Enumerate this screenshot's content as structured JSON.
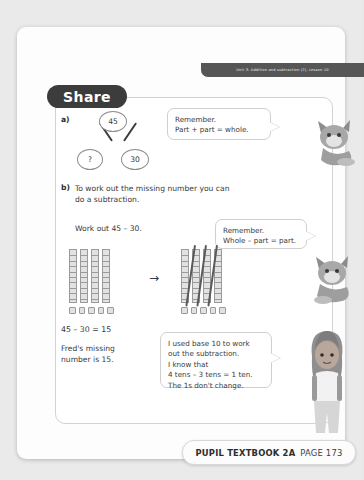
{
  "banner": {
    "unit_text": "Unit 3: Addition and subtraction (2), Lesson 10"
  },
  "section": {
    "title": "Share"
  },
  "part_a": {
    "label": "a)",
    "part_whole": {
      "whole": "45",
      "part_left": "?",
      "part_right": "30"
    },
    "bubble": {
      "line1": "Remember.",
      "line2": "Part + part = whole."
    }
  },
  "part_b": {
    "label": "b)",
    "text_line1": "To work out the missing number you can",
    "text_line2": "do a subtraction.",
    "work_out": "Work out 45 – 30.",
    "bubble": {
      "line1": "Remember.",
      "line2": "Whole – part = part."
    },
    "base_ten": {
      "left_tens": 4,
      "left_ones": 5,
      "right_tens": 4,
      "right_ones": 5,
      "crossed_tens": 3,
      "arrow_glyph": "→"
    },
    "equation": "45 – 30 = 15",
    "answer_line1": "Fred's missing",
    "answer_line2": "number is 15.",
    "bubble_big": {
      "line1": "I used base 10 to work",
      "line2": "out the subtraction.",
      "line3": "I know that",
      "line4": "4 tens – 3 tens = 1 ten.",
      "line5": "The 1s don't change."
    }
  },
  "footer": {
    "page_number": "173",
    "book_label": "PUPIL TEXTBOOK 2A",
    "page_label": "PAGE 173"
  },
  "colors": {
    "banner_bg": "#565656",
    "pill_bg": "#3c3c3c",
    "page_bg": "#fdfdfd",
    "frame_border": "#d2d2d2",
    "text": "#3a3a3a"
  }
}
